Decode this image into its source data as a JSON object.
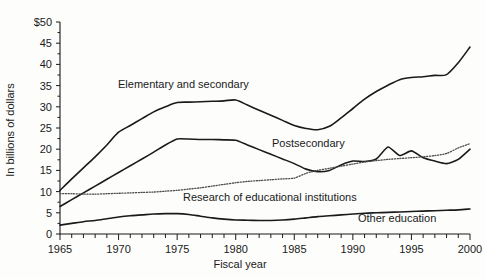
{
  "chart_data": {
    "type": "line",
    "title": "",
    "xlabel": "Fiscal year",
    "ylabel": "In billions of dollars",
    "xlim": [
      1965,
      2000
    ],
    "ylim": [
      0,
      50
    ],
    "ytick_labels": [
      "0",
      "5",
      "10",
      "15",
      "20",
      "25",
      "30",
      "35",
      "40",
      "45",
      "$50"
    ],
    "ytick_values": [
      0,
      5,
      10,
      15,
      20,
      25,
      30,
      35,
      40,
      45,
      50
    ],
    "xtick_labels": [
      "1965",
      "1970",
      "1975",
      "1980",
      "1985",
      "1990",
      "1995",
      "2000"
    ],
    "xtick_values": [
      1965,
      1970,
      1975,
      1980,
      1985,
      1990,
      1995,
      2000
    ],
    "minor_xtick_interval": 1,
    "grid": false,
    "legend": "inline-annotations",
    "x": [
      1965,
      1966,
      1967,
      1968,
      1969,
      1970,
      1971,
      1972,
      1973,
      1974,
      1975,
      1976,
      1977,
      1978,
      1979,
      1980,
      1981,
      1982,
      1983,
      1984,
      1985,
      1986,
      1987,
      1988,
      1989,
      1990,
      1991,
      1992,
      1993,
      1994,
      1995,
      1996,
      1997,
      1998,
      1999,
      2000
    ],
    "series": [
      {
        "name": "Elementary and secondary",
        "style": "solid",
        "values": [
          10.3,
          13.0,
          15.6,
          18.2,
          21.0,
          24.0,
          25.6,
          27.2,
          28.8,
          30.0,
          31.0,
          31.1,
          31.2,
          31.3,
          31.4,
          31.6,
          30.4,
          29.2,
          28.0,
          26.8,
          25.6,
          24.9,
          24.6,
          25.4,
          27.4,
          29.6,
          31.8,
          33.6,
          35.1,
          36.4,
          36.9,
          37.1,
          37.4,
          37.6,
          40.4,
          44.1
        ]
      },
      {
        "name": "Postsecondary",
        "style": "solid",
        "values": [
          6.5,
          8.1,
          9.7,
          11.3,
          12.9,
          14.5,
          16.1,
          17.7,
          19.3,
          21.0,
          22.4,
          22.4,
          22.3,
          22.3,
          22.2,
          22.1,
          21.0,
          19.9,
          18.8,
          17.7,
          16.6,
          15.3,
          14.7,
          15.0,
          16.3,
          17.2,
          17.1,
          17.7,
          20.5,
          18.5,
          19.6,
          18.0,
          17.2,
          16.6,
          17.6,
          20.0
        ]
      },
      {
        "name": "Research of educational institutions",
        "style": "dotted",
        "values": [
          9.5,
          9.5,
          9.4,
          9.4,
          9.5,
          9.6,
          9.7,
          9.8,
          9.9,
          10.1,
          10.3,
          10.6,
          10.9,
          11.3,
          11.7,
          12.1,
          12.4,
          12.6,
          12.8,
          13.0,
          13.2,
          14.3,
          15.0,
          15.5,
          16.0,
          16.5,
          17.0,
          17.3,
          17.6,
          17.8,
          18.0,
          18.2,
          18.5,
          19.0,
          20.3,
          21.3
        ]
      },
      {
        "name": "Other education",
        "style": "solid",
        "values": [
          2.1,
          2.5,
          2.9,
          3.2,
          3.6,
          4.0,
          4.3,
          4.5,
          4.7,
          4.8,
          4.8,
          4.6,
          4.2,
          3.8,
          3.5,
          3.3,
          3.25,
          3.2,
          3.2,
          3.3,
          3.5,
          3.8,
          4.1,
          4.3,
          4.5,
          4.7,
          4.9,
          5.0,
          5.1,
          5.2,
          5.3,
          5.4,
          5.5,
          5.6,
          5.7,
          5.9
        ]
      }
    ],
    "annotations": [
      {
        "text": "Elementary and secondary",
        "x_px": 118,
        "y_px": 88
      },
      {
        "text": "Postsecondary",
        "x_px": 272,
        "y_px": 147
      },
      {
        "text": "Research of educational institutions",
        "x_px": 183,
        "y_px": 201
      },
      {
        "text": "Other education",
        "x_px": 358,
        "y_px": 222
      }
    ],
    "colors": {
      "line": "#1a1a1a",
      "dotted_line": "#4a4a4a",
      "background": "#fdfdfc",
      "text": "#1a1a1a"
    }
  }
}
